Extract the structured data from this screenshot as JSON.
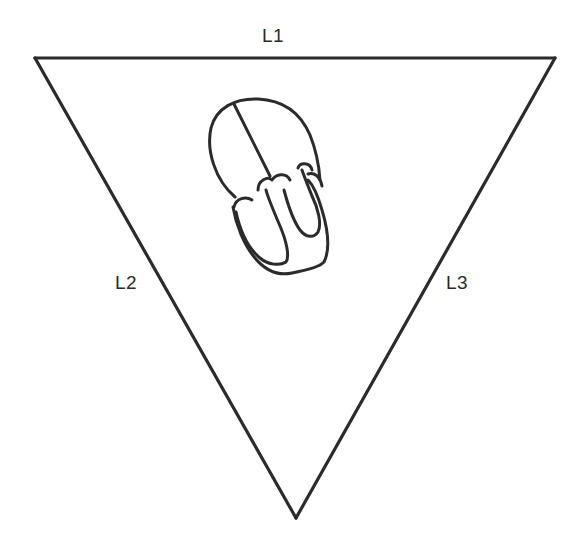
{
  "diagram": {
    "type": "einthoven-triangle",
    "labels": {
      "top": "L1",
      "left": "L2",
      "right": "L3"
    },
    "triangle": {
      "vertices": {
        "top_left": [
          35,
          58
        ],
        "top_right": [
          555,
          58
        ],
        "bottom": [
          296,
          518
        ]
      },
      "stroke_color": "#2b2b2b"
    },
    "center_illustration": "heart-outline-icon",
    "colors": {
      "background": "#ffffff",
      "line": "#2b2b2b",
      "text": "#2a2a2a"
    }
  }
}
